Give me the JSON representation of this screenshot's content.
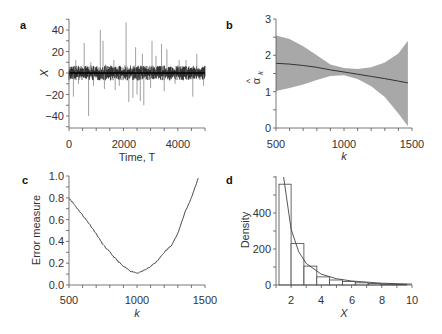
{
  "chart_data": [
    {
      "panel": "a",
      "type": "line",
      "xlabel": "Time, T",
      "ylabel": "X",
      "xlim": [
        0,
        5000
      ],
      "ylim": [
        -50,
        50
      ],
      "xticks": [
        0,
        2000,
        4000
      ],
      "yticks": [
        -40,
        -20,
        0,
        20,
        40
      ],
      "description": "Heavy-tailed time series of length 5000 centered at 0 with spikes",
      "spikes_positive": [
        [
          250,
          12
        ],
        [
          560,
          28
        ],
        [
          800,
          10
        ],
        [
          1150,
          40
        ],
        [
          1250,
          30
        ],
        [
          1350,
          8
        ],
        [
          1650,
          12
        ],
        [
          2100,
          47
        ],
        [
          2450,
          24
        ],
        [
          2700,
          18
        ],
        [
          3050,
          30
        ],
        [
          3200,
          16
        ],
        [
          3400,
          27
        ],
        [
          3600,
          22
        ],
        [
          4050,
          12
        ],
        [
          4300,
          12
        ],
        [
          4700,
          18
        ]
      ],
      "spikes_negative": [
        [
          160,
          -22
        ],
        [
          350,
          -10
        ],
        [
          720,
          -40
        ],
        [
          900,
          -12
        ],
        [
          1300,
          -15
        ],
        [
          1700,
          -16
        ],
        [
          1850,
          -12
        ],
        [
          2200,
          -27
        ],
        [
          2350,
          -23
        ],
        [
          2500,
          -20
        ],
        [
          2620,
          -26
        ],
        [
          2750,
          -30
        ],
        [
          3000,
          -14
        ],
        [
          3500,
          -17
        ],
        [
          3900,
          -10
        ],
        [
          4550,
          -22
        ],
        [
          4950,
          -12
        ]
      ],
      "grid": false
    },
    {
      "panel": "b",
      "type": "area",
      "xlabel": "k",
      "ylabel": "α̂k",
      "xlim": [
        500,
        1500
      ],
      "ylim": [
        0,
        3
      ],
      "xticks": [
        500,
        1000,
        1500
      ],
      "yticks": [
        0,
        1,
        2,
        3
      ],
      "x": [
        500,
        600,
        700,
        800,
        900,
        1000,
        1100,
        1200,
        1300,
        1400,
        1470
      ],
      "series": [
        {
          "name": "estimate",
          "values": [
            1.78,
            1.76,
            1.72,
            1.67,
            1.6,
            1.54,
            1.48,
            1.42,
            1.36,
            1.29,
            1.24
          ]
        },
        {
          "name": "upper",
          "values": [
            2.55,
            2.45,
            2.25,
            2.0,
            1.75,
            1.65,
            1.62,
            1.67,
            1.8,
            2.05,
            2.4
          ]
        },
        {
          "name": "lower",
          "values": [
            1.02,
            1.1,
            1.2,
            1.32,
            1.43,
            1.45,
            1.35,
            1.15,
            0.85,
            0.4,
            0.05
          ]
        }
      ],
      "grid": false
    },
    {
      "panel": "c",
      "type": "line",
      "xlabel": "k",
      "ylabel": "Error measure",
      "xlim": [
        500,
        1500
      ],
      "ylim": [
        0.0,
        1.0
      ],
      "xticks": [
        500,
        1000,
        1500
      ],
      "yticks": [
        "0.0",
        "0.2",
        "0.4",
        "0.6",
        "0.8",
        "1.0"
      ],
      "x": [
        500,
        550,
        600,
        650,
        700,
        750,
        800,
        850,
        900,
        950,
        1000,
        1050,
        1100,
        1150,
        1200,
        1250,
        1300,
        1350,
        1400,
        1450
      ],
      "values": [
        0.8,
        0.72,
        0.64,
        0.56,
        0.47,
        0.37,
        0.3,
        0.23,
        0.17,
        0.13,
        0.11,
        0.13,
        0.17,
        0.22,
        0.3,
        0.36,
        0.47,
        0.66,
        0.8,
        0.98
      ],
      "grid": false
    },
    {
      "panel": "d",
      "type": "bar",
      "xlabel": "X",
      "ylabel": "Density",
      "xlim": [
        1,
        10
      ],
      "ylim": [
        0,
        600
      ],
      "xticks": [
        2,
        4,
        6,
        8,
        10
      ],
      "yticks": [
        0,
        200,
        400
      ],
      "bin_edges": [
        1.2,
        2.0,
        2.85,
        3.7,
        4.55,
        5.4,
        6.25,
        7.1,
        7.95,
        8.8,
        9.65
      ],
      "values": [
        560,
        230,
        105,
        45,
        28,
        20,
        12,
        8,
        5,
        3
      ],
      "fit_curve": {
        "name": "power-law density fit",
        "x": [
          1.5,
          2,
          2.5,
          3,
          4,
          5,
          6,
          8,
          10
        ],
        "y": [
          600,
          310,
          185,
          120,
          60,
          35,
          22,
          10,
          5
        ]
      },
      "grid": false
    }
  ],
  "panels": {
    "a": {
      "letter": "a",
      "xlabel": "Time, T",
      "ylabel": "X",
      "yticks": [
        "40",
        "20",
        "0",
        "−20",
        "−40"
      ],
      "xticks": [
        "0",
        "2000",
        "4000"
      ]
    },
    "b": {
      "letter": "b",
      "xlabel": "k",
      "ylabel_main": "α",
      "ylabel_sub": "k",
      "ylabel_hat": "^",
      "yticks": [
        "3",
        "2",
        "1",
        "0"
      ],
      "xticks": [
        "500",
        "1000",
        "1500"
      ]
    },
    "c": {
      "letter": "c",
      "xlabel": "k",
      "ylabel": "Error measure",
      "yticks": [
        "1.0",
        "0.8",
        "0.6",
        "0.4",
        "0.2",
        "0.0"
      ],
      "xticks": [
        "500",
        "1000",
        "1500"
      ]
    },
    "d": {
      "letter": "d",
      "xlabel": "X",
      "ylabel": "Density",
      "yticks": [
        "400",
        "200",
        "0"
      ],
      "xticks": [
        "2",
        "4",
        "6",
        "8",
        "10"
      ]
    }
  },
  "colors": {
    "axis": "#555555",
    "band": "#a8a8a8",
    "line": "#333333",
    "spike_dark": "#000000",
    "spike_light": "#777777"
  }
}
